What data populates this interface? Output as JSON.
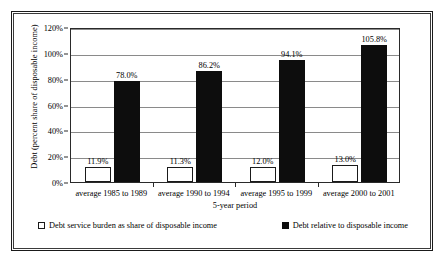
{
  "chart_data": {
    "type": "bar",
    "title": "",
    "xlabel": "5-year period",
    "ylabel": "Debt (percent share of disposable income)",
    "categories": [
      "average 1985 to 1989",
      "average 1990 to 1994",
      "average 1995 to 1999",
      "average 2000 to 2001"
    ],
    "series": [
      {
        "name": "Debt service burden as share of disposable income",
        "style": "open",
        "values": [
          11.9,
          11.3,
          12.0,
          13.0
        ],
        "labels": [
          "11.9%",
          "11.3%",
          "12.0%",
          "13.0%"
        ]
      },
      {
        "name": "Debt relative to disposable income",
        "style": "solid",
        "values": [
          78.0,
          86.2,
          94.1,
          105.8
        ],
        "labels": [
          "78.0%",
          "86.2%",
          "94.1%",
          "105.8%"
        ]
      }
    ],
    "ylim": [
      0,
      120
    ],
    "yticks": [
      0,
      20,
      40,
      60,
      80,
      100,
      120
    ],
    "ytick_labels": [
      "0%",
      "20%",
      "40%",
      "60%",
      "80%",
      "100%",
      "120%"
    ],
    "grid": true,
    "legend_position": "bottom"
  },
  "legend": {
    "items": [
      {
        "label": "Debt service burden as share of disposable income",
        "style": "open"
      },
      {
        "label": "Debt relative to disposable income",
        "style": "solid"
      }
    ]
  }
}
